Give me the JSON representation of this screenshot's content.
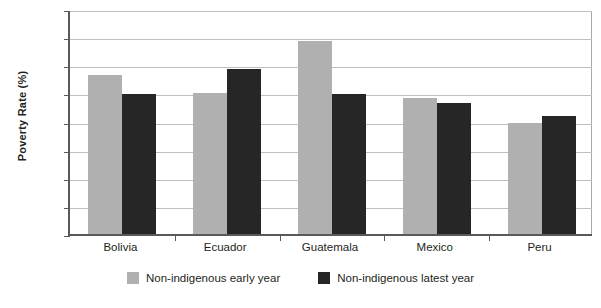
{
  "chart_data": {
    "type": "bar",
    "title": "",
    "xlabel": "",
    "ylabel": "Poverty Rate (%)",
    "categories": [
      "Bolivia",
      "Ecuador",
      "Guatemala",
      "Mexico",
      "Peru"
    ],
    "series": [
      {
        "name": "Non-indigenous early year",
        "color": "#b0b0b0",
        "values": [
          56.5,
          50.0,
          68.5,
          48.5,
          39.5
        ]
      },
      {
        "name": "Non-indigenous latest year",
        "color": "#262626",
        "values": [
          49.8,
          58.8,
          49.8,
          46.5,
          41.8
        ]
      }
    ],
    "ylim": [
      0,
      80
    ],
    "yticks": [
      0,
      10,
      20,
      30,
      40,
      50,
      60,
      70,
      80
    ],
    "ytick_labels": [
      "0",
      "10",
      "20",
      "30",
      "40",
      "50",
      "60",
      "70",
      "80"
    ],
    "grid": true,
    "legend_position": "bottom"
  },
  "legend": {
    "items": [
      {
        "label": "Non-indigenous early year",
        "swatch": "early"
      },
      {
        "label": "Non-indigenous latest year",
        "swatch": "latest"
      }
    ]
  }
}
